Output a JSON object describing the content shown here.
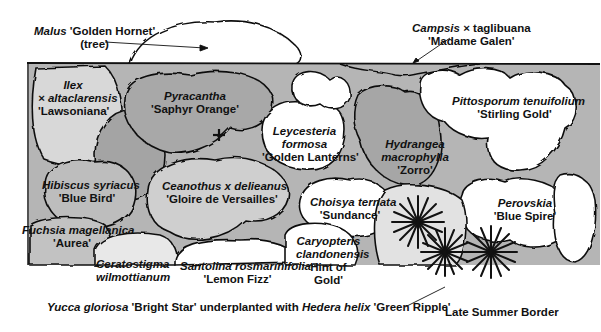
{
  "diagram": {
    "title": "Late Summer Border",
    "colors": {
      "background": "#ffffff",
      "bed_fill": "#b3b3b3",
      "shrub_dark": "#9a9a9a",
      "shrub_mid": "#c4c4c4",
      "shrub_light": "#e6e6e6",
      "shrub_white": "#ffffff",
      "outline": "#111111"
    },
    "callouts": {
      "malus": {
        "genus": "Malus",
        "cultivar": "'Golden Hornet'",
        "note": "(tree)"
      },
      "campsis": {
        "genus": "Campsis",
        "rest": "× taglibuana",
        "cultivar": "'Madame Galen'"
      },
      "yucca": {
        "genus": "Yucca gloriosa",
        "cultivar": "'Bright Star'",
        "joiner": "underplanted with",
        "genus2": "Hedera helix",
        "cultivar2": "'Green Ripple'"
      }
    },
    "plants": [
      {
        "id": "ilex",
        "line1": "Ilex",
        "line2": "× altaclarensis",
        "line3": "'Lawsoniana'"
      },
      {
        "id": "pyracantha",
        "line1": "Pyracantha",
        "line2": "'Saphyr Orange'"
      },
      {
        "id": "leycesteria",
        "line1": "Leycesteria",
        "line2": "formosa",
        "line3": "'Golden Lanterns'"
      },
      {
        "id": "hydrangea",
        "line1": "Hydrangea",
        "line2": "macrophylla",
        "line3": "'Zorro'"
      },
      {
        "id": "pittosporum",
        "line1": "Pittosporum tenuifolium",
        "line2": "'Stirling Gold'"
      },
      {
        "id": "hibiscus",
        "line1": "Hibiscus syriacus",
        "line2": "'Blue Bird'"
      },
      {
        "id": "ceanothus",
        "line1": "Ceanothus x delieanus",
        "line2": "'Gloire de Versailles'"
      },
      {
        "id": "choisya",
        "line1": "Choisya ternata",
        "line2": "'Sundance'"
      },
      {
        "id": "perovskia",
        "line1": "Perovskia",
        "line2": "'Blue Spire'"
      },
      {
        "id": "fuchsia",
        "line1": "Fuchsia magellanica",
        "line2": "'Aurea'"
      },
      {
        "id": "ceratostigma",
        "line1": "Ceratostigma",
        "line2": "wilmottianum"
      },
      {
        "id": "santolina",
        "line1": "Santolina rosmarinifolia",
        "line2": "'Lemon Fizz'"
      },
      {
        "id": "caryopteris",
        "line1": "Caryopteris",
        "line2": "clandonensis",
        "line3": "Hint of",
        "line4": "Gold'"
      }
    ]
  }
}
